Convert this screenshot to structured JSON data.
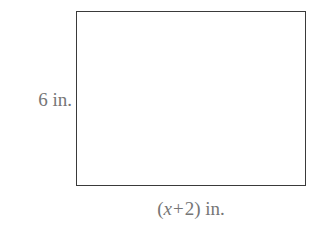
{
  "figure": {
    "type": "rectangle-diagram",
    "background_color": "#ffffff",
    "shape": {
      "name": "rectangle",
      "stroke_color": "#3a3a3a",
      "fill_color": "#ffffff",
      "stroke_width_px": 1.8,
      "x_px": 76,
      "y_px": 11,
      "width_px": 230,
      "height_px": 175
    },
    "labels": {
      "text_color": "#767676",
      "height": {
        "full_text": "6 in.",
        "value": "6",
        "unit": "in.",
        "position": "left"
      },
      "width": {
        "full_text": "(x + 2) in.",
        "open_paren": "(",
        "variable": "x",
        "operator": "+",
        "constant": "2",
        "close_paren": ")",
        "unit": "in.",
        "position": "bottom"
      }
    }
  }
}
